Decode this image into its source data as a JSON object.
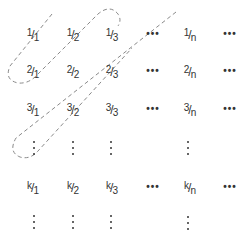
{
  "diagram": {
    "rows": [
      {
        "num": "1",
        "cells": [
          {
            "num": "1",
            "den": "1"
          },
          {
            "num": "1",
            "den": "2"
          },
          {
            "num": "1",
            "den": "3"
          },
          {
            "dots": "h"
          },
          {
            "num": "1",
            "den": "n"
          },
          {
            "dots": "h"
          }
        ]
      },
      {
        "num": "2",
        "cells": [
          {
            "num": "2",
            "den": "1"
          },
          {
            "num": "2",
            "den": "2"
          },
          {
            "num": "2",
            "den": "3"
          },
          {
            "dots": "h"
          },
          {
            "num": "2",
            "den": "n"
          },
          {
            "dots": "h"
          }
        ]
      },
      {
        "num": "3",
        "cells": [
          {
            "num": "3",
            "den": "1"
          },
          {
            "num": "3",
            "den": "2"
          },
          {
            "num": "3",
            "den": "3"
          },
          {
            "dots": "h"
          },
          {
            "num": "3",
            "den": "n"
          },
          {
            "dots": "h"
          }
        ]
      },
      {
        "num": "k",
        "cells": [
          {
            "num": "k",
            "den": "1"
          },
          {
            "num": "k",
            "den": "2"
          },
          {
            "num": "k",
            "den": "3"
          },
          {
            "dots": "h"
          },
          {
            "num": "k",
            "den": "n"
          },
          {
            "dots": "h"
          }
        ]
      }
    ],
    "labels": {
      "r1c1_num": "1",
      "r1c1_den": "1",
      "r1c2_num": "1",
      "r1c2_den": "2",
      "r1c3_num": "1",
      "r1c3_den": "3",
      "r1cn_num": "1",
      "r1cn_den": "n",
      "r2c1_num": "2",
      "r2c1_den": "1",
      "r2c2_num": "2",
      "r2c2_den": "2",
      "r2c3_num": "2",
      "r2c3_den": "3",
      "r2cn_num": "2",
      "r2cn_den": "n",
      "r3c1_num": "3",
      "r3c1_den": "1",
      "r3c2_num": "3",
      "r3c2_den": "2",
      "r3c3_num": "3",
      "r3c3_den": "3",
      "r3cn_num": "3",
      "r3cn_den": "n",
      "rkc1_num": "k",
      "rkc1_den": "1",
      "rkc2_num": "k",
      "rkc2_den": "2",
      "rkc3_num": "k",
      "rkc3_den": "3",
      "rkcn_num": "k",
      "rkcn_den": "n",
      "slash": "/",
      "hdots": "•••"
    },
    "path_style": {
      "stroke": "#888888",
      "dash": "4 3"
    }
  }
}
